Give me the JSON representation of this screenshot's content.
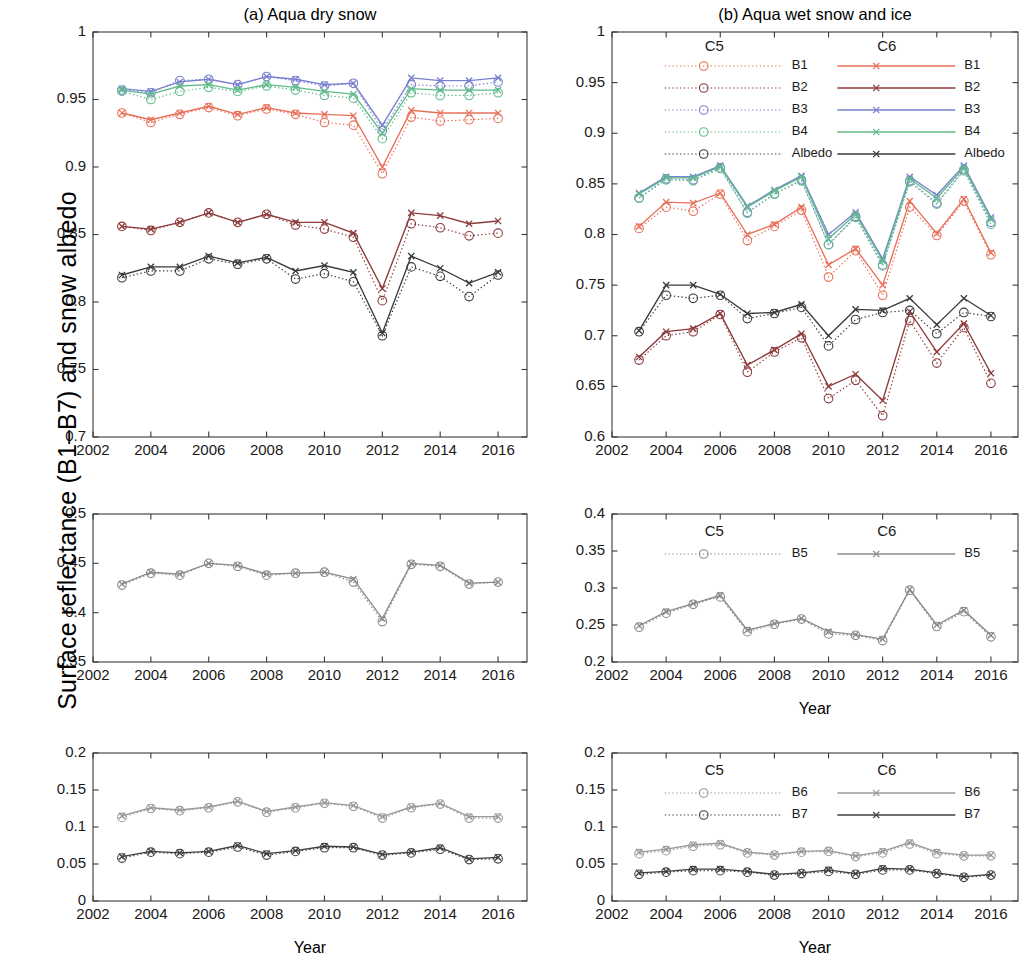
{
  "figure": {
    "y_axis_label": "Surface reflectance (B1–B7) and snow albedo",
    "x_axis_label": "Year"
  },
  "panels": {
    "a_title": "(a)  Aqua dry snow",
    "b_title": "(b)  Aqua wet snow and ice"
  },
  "legend": {
    "c5_header": "C5",
    "c6_header": "C6",
    "top_entries": [
      "B1",
      "B2",
      "B3",
      "B4",
      "Albedo"
    ],
    "mid_entries": [
      "B5"
    ],
    "bottom_entries": [
      "B6",
      "B7"
    ]
  },
  "colors": {
    "B1": "#e8705a",
    "B2": "#8c3a3a",
    "B3": "#7a7fd0",
    "B4": "#5fbb8a",
    "Albedo": "#3a3a3a",
    "B5": "#8a8a8a",
    "B6": "#9a9a9a",
    "B7": "#3f3f3f",
    "axis": "#3a3a3a"
  },
  "chart_data": [
    {
      "id": "panel-a-top",
      "type": "line",
      "title": "(a)  Aqua dry snow",
      "xlabel": "Year",
      "ylabel": "Surface reflectance (B1–B7) and snow albedo",
      "xlim": [
        2002,
        2017
      ],
      "ylim": [
        0.7,
        1.0
      ],
      "xticks": [
        2002,
        2004,
        2006,
        2008,
        2010,
        2012,
        2014,
        2016
      ],
      "yticks": [
        0.7,
        0.75,
        0.8,
        0.85,
        0.9,
        0.95,
        1
      ],
      "ytick_labels": [
        "0.7",
        "0.75",
        "0.8",
        "0.85",
        "0.9",
        "0.95",
        "1"
      ],
      "grid": false,
      "x": [
        2003,
        2004,
        2005,
        2006,
        2007,
        2008,
        2009,
        2010,
        2011,
        2012,
        2013,
        2014,
        2015,
        2016
      ],
      "series": [
        {
          "name": "B1",
          "collection": "C6",
          "style": "solid-cross",
          "color": "#e8705a",
          "values": [
            0.94,
            0.935,
            0.94,
            0.945,
            0.939,
            0.944,
            0.94,
            0.939,
            0.938,
            0.9,
            0.942,
            0.94,
            0.94,
            0.94
          ]
        },
        {
          "name": "B1",
          "collection": "C5",
          "style": "dotted-circle",
          "color": "#e8705a",
          "values": [
            0.94,
            0.933,
            0.939,
            0.944,
            0.938,
            0.943,
            0.939,
            0.933,
            0.931,
            0.895,
            0.937,
            0.934,
            0.935,
            0.936
          ]
        },
        {
          "name": "B2",
          "collection": "C6",
          "style": "solid-cross",
          "color": "#8c3a3a",
          "values": [
            0.856,
            0.854,
            0.859,
            0.866,
            0.859,
            0.865,
            0.859,
            0.859,
            0.851,
            0.81,
            0.866,
            0.864,
            0.858,
            0.86
          ]
        },
        {
          "name": "B2",
          "collection": "C5",
          "style": "dotted-circle",
          "color": "#8c3a3a",
          "values": [
            0.856,
            0.853,
            0.859,
            0.866,
            0.859,
            0.865,
            0.857,
            0.854,
            0.848,
            0.801,
            0.858,
            0.855,
            0.849,
            0.851
          ]
        },
        {
          "name": "B3",
          "collection": "C6",
          "style": "solid-cross",
          "color": "#7a7fd0",
          "values": [
            0.958,
            0.956,
            0.963,
            0.965,
            0.961,
            0.967,
            0.965,
            0.961,
            0.962,
            0.931,
            0.966,
            0.964,
            0.964,
            0.966
          ]
        },
        {
          "name": "B3",
          "collection": "C5",
          "style": "dotted-circle",
          "color": "#7a7fd0",
          "values": [
            0.957,
            0.955,
            0.964,
            0.965,
            0.961,
            0.967,
            0.964,
            0.96,
            0.962,
            0.927,
            0.961,
            0.96,
            0.96,
            0.963
          ]
        },
        {
          "name": "B4",
          "collection": "C6",
          "style": "solid-cross",
          "color": "#5fbb8a",
          "values": [
            0.957,
            0.954,
            0.96,
            0.961,
            0.957,
            0.961,
            0.959,
            0.956,
            0.954,
            0.925,
            0.958,
            0.957,
            0.957,
            0.957
          ]
        },
        {
          "name": "B4",
          "collection": "C5",
          "style": "dotted-circle",
          "color": "#5fbb8a",
          "values": [
            0.956,
            0.95,
            0.956,
            0.959,
            0.956,
            0.96,
            0.957,
            0.953,
            0.951,
            0.921,
            0.955,
            0.953,
            0.953,
            0.955
          ]
        },
        {
          "name": "Albedo",
          "collection": "C6",
          "style": "solid-cross",
          "color": "#3a3a3a",
          "values": [
            0.82,
            0.826,
            0.826,
            0.834,
            0.829,
            0.833,
            0.823,
            0.827,
            0.822,
            0.777,
            0.834,
            0.825,
            0.814,
            0.822
          ]
        },
        {
          "name": "Albedo",
          "collection": "C5",
          "style": "dotted-circle",
          "color": "#3a3a3a",
          "values": [
            0.818,
            0.823,
            0.823,
            0.832,
            0.828,
            0.832,
            0.817,
            0.821,
            0.815,
            0.775,
            0.826,
            0.819,
            0.804,
            0.82
          ]
        }
      ]
    },
    {
      "id": "panel-b-top",
      "type": "line",
      "title": "(b)  Aqua wet snow and ice",
      "xlabel": "Year",
      "ylabel": "Surface reflectance (B1–B7) and snow albedo",
      "xlim": [
        2002,
        2017
      ],
      "ylim": [
        0.6,
        1.0
      ],
      "xticks": [
        2002,
        2004,
        2006,
        2008,
        2010,
        2012,
        2014,
        2016
      ],
      "yticks": [
        0.6,
        0.65,
        0.7,
        0.75,
        0.8,
        0.85,
        0.9,
        0.95,
        1
      ],
      "ytick_labels": [
        "0.6",
        "0.65",
        "0.7",
        "0.75",
        "0.8",
        "0.85",
        "0.9",
        "0.95",
        "1"
      ],
      "grid": false,
      "x": [
        2003,
        2004,
        2005,
        2006,
        2007,
        2008,
        2009,
        2010,
        2011,
        2012,
        2013,
        2014,
        2015,
        2016
      ],
      "series": [
        {
          "name": "B1",
          "collection": "C6",
          "style": "solid-cross",
          "color": "#e8705a",
          "values": [
            0.808,
            0.832,
            0.831,
            0.841,
            0.8,
            0.81,
            0.827,
            0.77,
            0.786,
            0.75,
            0.833,
            0.801,
            0.835,
            0.782
          ]
        },
        {
          "name": "B1",
          "collection": "C5",
          "style": "dotted-circle",
          "color": "#e8705a",
          "values": [
            0.806,
            0.827,
            0.823,
            0.84,
            0.794,
            0.808,
            0.824,
            0.758,
            0.784,
            0.74,
            0.827,
            0.799,
            0.833,
            0.78
          ]
        },
        {
          "name": "B2",
          "collection": "C6",
          "style": "solid-cross",
          "color": "#8c3a3a",
          "values": [
            0.679,
            0.704,
            0.707,
            0.722,
            0.671,
            0.686,
            0.702,
            0.65,
            0.662,
            0.636,
            0.724,
            0.684,
            0.712,
            0.663
          ]
        },
        {
          "name": "B2",
          "collection": "C5",
          "style": "dotted-circle",
          "color": "#8c3a3a",
          "values": [
            0.676,
            0.7,
            0.704,
            0.721,
            0.664,
            0.684,
            0.698,
            0.638,
            0.656,
            0.621,
            0.715,
            0.673,
            0.708,
            0.653
          ]
        },
        {
          "name": "B3",
          "collection": "C6",
          "style": "solid-cross",
          "color": "#7a7fd0",
          "values": [
            0.841,
            0.857,
            0.857,
            0.868,
            0.828,
            0.844,
            0.858,
            0.8,
            0.822,
            0.776,
            0.857,
            0.839,
            0.868,
            0.817
          ]
        },
        {
          "name": "B3",
          "collection": "C5",
          "style": "dotted-circle",
          "color": "#7a7fd0",
          "values": [
            0.836,
            0.855,
            0.854,
            0.866,
            0.822,
            0.84,
            0.854,
            0.79,
            0.818,
            0.77,
            0.853,
            0.831,
            0.864,
            0.812
          ]
        },
        {
          "name": "B4",
          "collection": "C6",
          "style": "solid-cross",
          "color": "#5fbb8a",
          "values": [
            0.84,
            0.856,
            0.856,
            0.867,
            0.827,
            0.843,
            0.857,
            0.796,
            0.82,
            0.774,
            0.855,
            0.836,
            0.866,
            0.815
          ]
        },
        {
          "name": "B4",
          "collection": "C5",
          "style": "dotted-circle",
          "color": "#5fbb8a",
          "values": [
            0.836,
            0.854,
            0.853,
            0.865,
            0.821,
            0.84,
            0.853,
            0.79,
            0.817,
            0.769,
            0.852,
            0.83,
            0.863,
            0.81
          ]
        },
        {
          "name": "Albedo",
          "collection": "C6",
          "style": "solid-cross",
          "color": "#3a3a3a",
          "values": [
            0.705,
            0.75,
            0.75,
            0.741,
            0.722,
            0.723,
            0.731,
            0.7,
            0.726,
            0.725,
            0.737,
            0.711,
            0.737,
            0.72
          ]
        },
        {
          "name": "Albedo",
          "collection": "C5",
          "style": "dotted-circle",
          "color": "#3a3a3a",
          "values": [
            0.704,
            0.74,
            0.737,
            0.74,
            0.717,
            0.722,
            0.728,
            0.69,
            0.716,
            0.723,
            0.725,
            0.702,
            0.723,
            0.719
          ]
        }
      ]
    },
    {
      "id": "panel-a-mid",
      "type": "line",
      "title": "",
      "xlabel": "Year",
      "ylabel": "",
      "xlim": [
        2002,
        2017
      ],
      "ylim": [
        0.35,
        0.5
      ],
      "xticks": [
        2002,
        2004,
        2006,
        2008,
        2010,
        2012,
        2014,
        2016
      ],
      "yticks": [
        0.35,
        0.4,
        0.45,
        0.5
      ],
      "ytick_labels": [
        "0.35",
        "0.4",
        "0.45",
        "0.5"
      ],
      "grid": false,
      "x": [
        2003,
        2004,
        2005,
        2006,
        2007,
        2008,
        2009,
        2010,
        2011,
        2012,
        2013,
        2014,
        2015,
        2016
      ],
      "series": [
        {
          "name": "B5",
          "collection": "C6",
          "style": "solid-cross",
          "color": "#8a8a8a",
          "values": [
            0.429,
            0.441,
            0.439,
            0.45,
            0.448,
            0.439,
            0.44,
            0.441,
            0.434,
            0.394,
            0.45,
            0.448,
            0.43,
            0.431
          ]
        },
        {
          "name": "B5",
          "collection": "C5",
          "style": "dotted-circle",
          "color": "#8a8a8a",
          "values": [
            0.428,
            0.44,
            0.438,
            0.45,
            0.447,
            0.438,
            0.44,
            0.441,
            0.431,
            0.391,
            0.449,
            0.447,
            0.429,
            0.431
          ]
        }
      ]
    },
    {
      "id": "panel-b-mid",
      "type": "line",
      "title": "",
      "xlabel": "Year",
      "ylabel": "",
      "xlim": [
        2002,
        2017
      ],
      "ylim": [
        0.2,
        0.4
      ],
      "xticks": [
        2002,
        2004,
        2006,
        2008,
        2010,
        2012,
        2014,
        2016
      ],
      "yticks": [
        0.2,
        0.25,
        0.3,
        0.35,
        0.4
      ],
      "ytick_labels": [
        "0.2",
        "0.25",
        "0.3",
        "0.35",
        "0.4"
      ],
      "grid": false,
      "x": [
        2003,
        2004,
        2005,
        2006,
        2007,
        2008,
        2009,
        2010,
        2011,
        2012,
        2013,
        2014,
        2015,
        2016
      ],
      "series": [
        {
          "name": "B5",
          "collection": "C6",
          "style": "solid-cross",
          "color": "#8a8a8a",
          "values": [
            0.249,
            0.268,
            0.279,
            0.29,
            0.243,
            0.252,
            0.259,
            0.241,
            0.237,
            0.231,
            0.298,
            0.25,
            0.27,
            0.236
          ]
        },
        {
          "name": "B5",
          "collection": "C5",
          "style": "dotted-circle",
          "color": "#8a8a8a",
          "values": [
            0.247,
            0.266,
            0.278,
            0.288,
            0.241,
            0.251,
            0.258,
            0.238,
            0.236,
            0.229,
            0.297,
            0.248,
            0.268,
            0.234
          ]
        }
      ]
    },
    {
      "id": "panel-a-bottom",
      "type": "line",
      "title": "",
      "xlabel": "Year",
      "ylabel": "",
      "xlim": [
        2002,
        2017
      ],
      "ylim": [
        0,
        0.2
      ],
      "xticks": [
        2002,
        2004,
        2006,
        2008,
        2010,
        2012,
        2014,
        2016
      ],
      "yticks": [
        0,
        0.05,
        0.1,
        0.15,
        0.2
      ],
      "ytick_labels": [
        "0",
        "0.05",
        "0.1",
        "0.15",
        "0.2"
      ],
      "grid": false,
      "x": [
        2003,
        2004,
        2005,
        2006,
        2007,
        2008,
        2009,
        2010,
        2011,
        2012,
        2013,
        2014,
        2015,
        2016
      ],
      "series": [
        {
          "name": "B6",
          "collection": "C6",
          "style": "solid-cross",
          "color": "#9a9a9a",
          "values": [
            0.115,
            0.126,
            0.123,
            0.127,
            0.135,
            0.121,
            0.127,
            0.133,
            0.129,
            0.114,
            0.127,
            0.132,
            0.114,
            0.114
          ]
        },
        {
          "name": "B6",
          "collection": "C5",
          "style": "dotted-circle",
          "color": "#9a9a9a",
          "values": [
            0.113,
            0.125,
            0.122,
            0.126,
            0.134,
            0.12,
            0.126,
            0.132,
            0.128,
            0.112,
            0.126,
            0.131,
            0.112,
            0.112
          ]
        },
        {
          "name": "B7",
          "collection": "C6",
          "style": "solid-cross",
          "color": "#3f3f3f",
          "values": [
            0.06,
            0.067,
            0.065,
            0.067,
            0.075,
            0.064,
            0.068,
            0.074,
            0.073,
            0.063,
            0.066,
            0.072,
            0.057,
            0.059
          ]
        },
        {
          "name": "B7",
          "collection": "C5",
          "style": "dotted-circle",
          "color": "#3f3f3f",
          "values": [
            0.058,
            0.066,
            0.064,
            0.066,
            0.073,
            0.062,
            0.067,
            0.072,
            0.072,
            0.062,
            0.065,
            0.07,
            0.056,
            0.057
          ]
        }
      ]
    },
    {
      "id": "panel-b-bottom",
      "type": "line",
      "title": "",
      "xlabel": "Year",
      "ylabel": "",
      "xlim": [
        2002,
        2017
      ],
      "ylim": [
        0,
        0.2
      ],
      "xticks": [
        2002,
        2004,
        2006,
        2008,
        2010,
        2012,
        2014,
        2016
      ],
      "yticks": [
        0,
        0.05,
        0.1,
        0.15,
        0.2
      ],
      "ytick_labels": [
        "0",
        "0.05",
        "0.1",
        "0.15",
        "0.2"
      ],
      "grid": false,
      "x": [
        2003,
        2004,
        2005,
        2006,
        2007,
        2008,
        2009,
        2010,
        2011,
        2012,
        2013,
        2014,
        2015,
        2016
      ],
      "series": [
        {
          "name": "B6",
          "collection": "C6",
          "style": "solid-cross",
          "color": "#9a9a9a",
          "values": [
            0.066,
            0.07,
            0.076,
            0.078,
            0.066,
            0.063,
            0.067,
            0.068,
            0.061,
            0.067,
            0.079,
            0.066,
            0.062,
            0.062
          ]
        },
        {
          "name": "B6",
          "collection": "C5",
          "style": "dotted-circle",
          "color": "#9a9a9a",
          "values": [
            0.064,
            0.068,
            0.074,
            0.076,
            0.065,
            0.062,
            0.066,
            0.067,
            0.06,
            0.065,
            0.077,
            0.064,
            0.061,
            0.061
          ]
        },
        {
          "name": "B7",
          "collection": "C6",
          "style": "solid-cross",
          "color": "#3f3f3f",
          "values": [
            0.038,
            0.04,
            0.043,
            0.043,
            0.04,
            0.036,
            0.038,
            0.042,
            0.037,
            0.044,
            0.043,
            0.038,
            0.033,
            0.036
          ]
        },
        {
          "name": "B7",
          "collection": "C5",
          "style": "dotted-circle",
          "color": "#3f3f3f",
          "values": [
            0.036,
            0.039,
            0.041,
            0.041,
            0.039,
            0.035,
            0.037,
            0.04,
            0.036,
            0.042,
            0.042,
            0.037,
            0.032,
            0.035
          ]
        }
      ]
    }
  ]
}
